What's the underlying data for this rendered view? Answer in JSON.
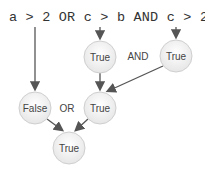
{
  "expression": "a > 2 OR c > b AND c > 2",
  "nodes": [
    {
      "id": "n1",
      "label": "True",
      "cx": 100,
      "cy": 57
    },
    {
      "id": "n2",
      "label": "True",
      "cx": 176,
      "cy": 56
    },
    {
      "id": "n3",
      "label": "False",
      "cx": 35,
      "cy": 108
    },
    {
      "id": "n4",
      "label": "True",
      "cx": 100,
      "cy": 108
    },
    {
      "id": "n5",
      "label": "True",
      "cx": 69,
      "cy": 148
    }
  ],
  "operators": [
    {
      "label": "AND",
      "x": 138,
      "y": 60
    },
    {
      "label": "OR",
      "x": 67,
      "y": 112
    }
  ]
}
